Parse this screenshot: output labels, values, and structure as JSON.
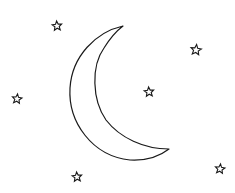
{
  "illustration": {
    "title": "crescent moon and stars line art",
    "background": "#ffffff",
    "stroke_color": "#1a1a1a",
    "moon": {
      "shape": "crescent",
      "opening": "right",
      "top_tip": [
        123,
        26
      ],
      "bottom_tip": [
        169,
        149
      ],
      "outer_leftmost": [
        70,
        88
      ],
      "inner_leftmost": [
        97,
        85
      ],
      "bottom_extreme": [
        130,
        160
      ]
    },
    "stars": [
      {
        "id": "star-top-left",
        "center": [
          57,
          26
        ],
        "size": 5
      },
      {
        "id": "star-top-right",
        "center": [
          196,
          50
        ],
        "size": 5.5
      },
      {
        "id": "star-middle",
        "center": [
          149,
          92
        ],
        "size": 5
      },
      {
        "id": "star-left",
        "center": [
          17,
          99
        ],
        "size": 5
      },
      {
        "id": "star-bottom-left",
        "center": [
          77,
          177
        ],
        "size": 5
      },
      {
        "id": "star-bottom-right",
        "center": [
          220,
          169
        ],
        "size": 5
      }
    ]
  }
}
